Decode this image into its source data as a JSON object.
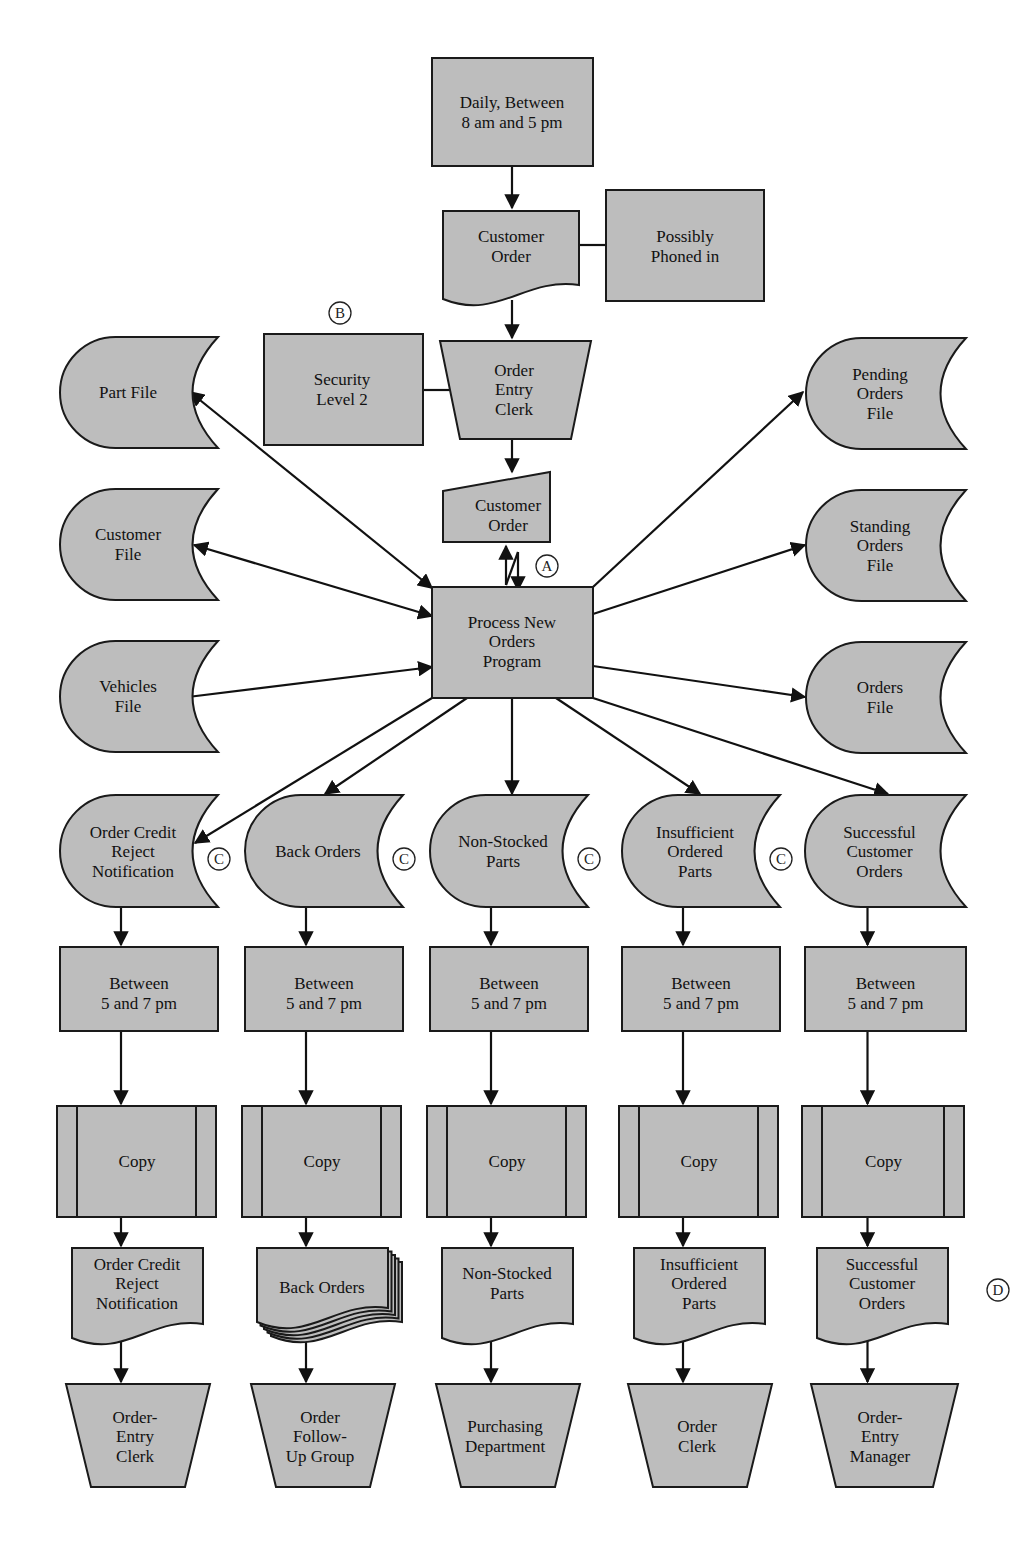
{
  "diagram": {
    "type": "systems flowchart",
    "fill_color": "#bdbdbd",
    "line_color": "#111111",
    "top": {
      "trigger": {
        "shape": "rectangle",
        "lines": [
          "Daily, Between",
          "8 am and 5 pm"
        ]
      },
      "input_document": {
        "shape": "document",
        "lines": [
          "Customer",
          "Order"
        ]
      },
      "annotation_phoned": {
        "shape": "rectangle",
        "lines": [
          "Possibly",
          "Phoned in"
        ]
      },
      "security": {
        "shape": "rectangle",
        "lines": [
          "Security",
          "Level 2"
        ],
        "marker": "B"
      },
      "clerk": {
        "shape": "manual-operation",
        "lines": [
          "Order",
          "Entry",
          "Clerk"
        ]
      },
      "online_input": {
        "shape": "manual-input",
        "lines": [
          "Customer",
          "Order"
        ]
      },
      "comm_link_marker": "A",
      "program": {
        "shape": "process",
        "lines": [
          "Process New",
          "Orders",
          "Program"
        ]
      }
    },
    "left_files": [
      {
        "id": "part-file",
        "lines": [
          "Part File"
        ],
        "direction": "both"
      },
      {
        "id": "customer-file",
        "lines": [
          "Customer",
          "File"
        ],
        "direction": "both"
      },
      {
        "id": "vehicles-file",
        "lines": [
          "Vehicles",
          "File"
        ],
        "direction": "in"
      }
    ],
    "right_files": [
      {
        "id": "pending-orders-file",
        "lines": [
          "Pending",
          "Orders",
          "File"
        ]
      },
      {
        "id": "standing-orders-file",
        "lines": [
          "Standing",
          "Orders",
          "File"
        ]
      },
      {
        "id": "orders-file",
        "lines": [
          "Orders",
          "File"
        ]
      }
    ],
    "columns": [
      {
        "file": [
          "Order Credit",
          "Reject",
          "Notification"
        ],
        "marker": "C",
        "schedule": [
          "Between",
          "5 and 7 pm"
        ],
        "process": [
          "Copy"
        ],
        "report": [
          "Order Credit",
          "Reject",
          "Notification"
        ],
        "report_type": "document",
        "recipient": [
          "Order-",
          "Entry",
          "Clerk"
        ]
      },
      {
        "file": [
          "Back Orders"
        ],
        "marker": "C",
        "schedule": [
          "Between",
          "5 and 7 pm"
        ],
        "process": [
          "Copy"
        ],
        "report": [
          "Back Orders"
        ],
        "report_type": "multi-document",
        "recipient": [
          "Order",
          "Follow-",
          "Up Group"
        ]
      },
      {
        "file": [
          "Non-Stocked",
          "Parts"
        ],
        "marker": "C",
        "schedule": [
          "Between",
          "5 and 7 pm"
        ],
        "process": [
          "Copy"
        ],
        "report": [
          "Non-Stocked",
          "Parts"
        ],
        "report_type": "document",
        "recipient": [
          "Purchasing",
          "Department"
        ]
      },
      {
        "file": [
          "Insufficient",
          "Ordered",
          "Parts"
        ],
        "marker": "C",
        "schedule": [
          "Between",
          "5 and 7 pm"
        ],
        "process": [
          "Copy"
        ],
        "report": [
          "Insufficient",
          "Ordered",
          "Parts"
        ],
        "report_type": "document",
        "recipient": [
          "Order",
          "Clerk"
        ]
      },
      {
        "file": [
          "Successful",
          "Customer",
          "Orders"
        ],
        "marker": "",
        "schedule": [
          "Between",
          "5 and 7 pm"
        ],
        "process": [
          "Copy"
        ],
        "report": [
          "Successful",
          "Customer",
          "Orders"
        ],
        "report_type": "document",
        "report_marker": "D",
        "recipient": [
          "Order-",
          "Entry",
          "Manager"
        ]
      }
    ]
  }
}
